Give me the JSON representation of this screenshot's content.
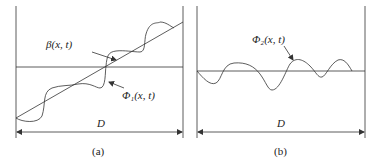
{
  "panels": [
    {
      "id": "a",
      "caption": "(a)",
      "labels": {
        "beta": "β(x, t)",
        "phi": "Φ₁(x, t)",
        "width": "D"
      }
    },
    {
      "id": "b",
      "caption": "(b)",
      "labels": {
        "phi": "Φ₂(x, t)",
        "width": "D"
      }
    }
  ],
  "colors": {
    "line": "#333333",
    "background": "#ffffff"
  }
}
